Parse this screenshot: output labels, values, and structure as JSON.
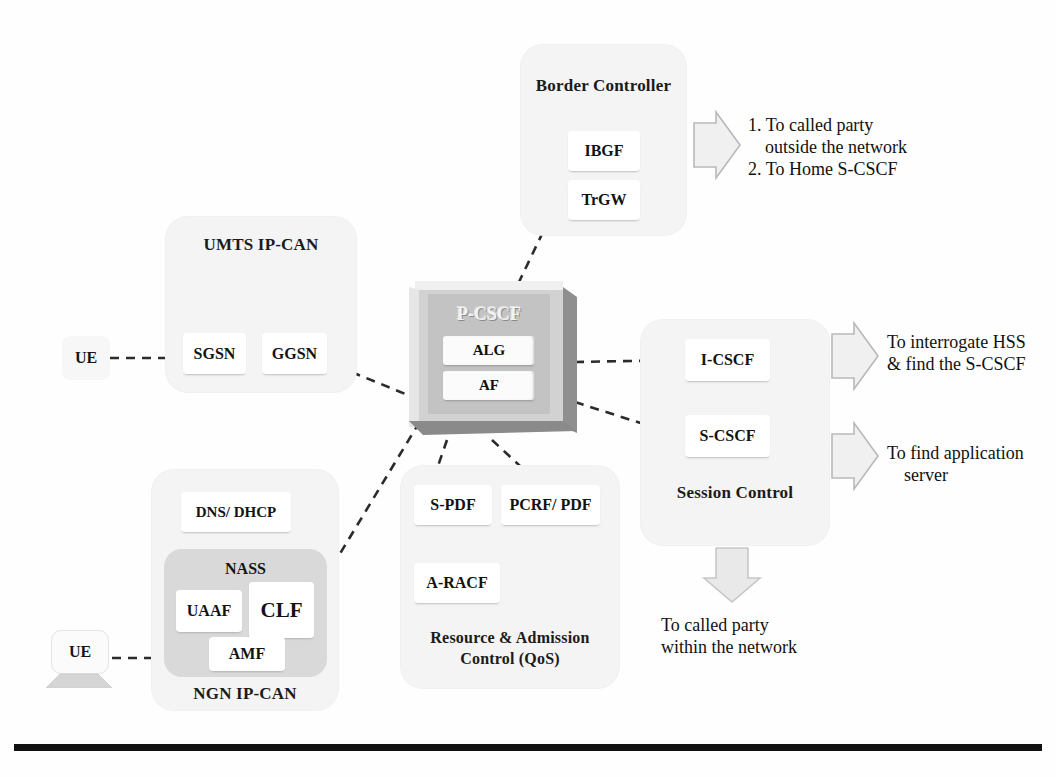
{
  "groups": {
    "border_controller": {
      "label": "Border Controller",
      "nodes": [
        {
          "label": "IBGF"
        },
        {
          "label": "TrGW"
        }
      ]
    },
    "umts": {
      "label": "UMTS IP-CAN",
      "nodes": [
        {
          "label": "SGSN"
        },
        {
          "label": "GGSN"
        }
      ]
    },
    "ngn": {
      "label": "NGN IP-CAN",
      "nodes": [
        {
          "label": "DNS/ DHCP"
        }
      ],
      "nass": {
        "label": "NASS",
        "nodes": [
          {
            "label": "UAAF"
          },
          {
            "label": "CLF"
          },
          {
            "label": "AMF"
          }
        ]
      }
    },
    "rac": {
      "label_line1": "Resource & Admission",
      "label_line2": "Control (QoS)",
      "nodes": [
        {
          "label": "S-PDF"
        },
        {
          "label": "PCRF/ PDF"
        },
        {
          "label": "A-RACF"
        }
      ]
    },
    "session_control": {
      "label": "Session Control",
      "nodes": [
        {
          "label": "I-CSCF"
        },
        {
          "label": "S-CSCF"
        }
      ]
    }
  },
  "core": {
    "title": "P-CSCF",
    "inner_nodes": [
      {
        "label": "ALG"
      },
      {
        "label": "AF"
      }
    ]
  },
  "endpoints": {
    "ue_umts": {
      "label": "UE"
    },
    "ue_ngn": {
      "label": "UE"
    }
  },
  "annotations": {
    "border_out": {
      "line1": "1. To called party",
      "line2": "outside the network",
      "line3": "2. To Home S-CSCF"
    },
    "icscf_out": {
      "line1": "To interrogate HSS",
      "line2": "& find the S-CSCF"
    },
    "scscf_out": {
      "line1": "To find application",
      "line2": "server"
    },
    "session_down": {
      "line1": "To called party",
      "line2": "within the network"
    }
  },
  "colors": {
    "group_fill": "#f4f4f4",
    "nass_fill": "#d9d9d9",
    "node_fill": "#ffffff",
    "core_face": "#c3c3c3",
    "core_frame": "#d2d2d2",
    "bevel_dark": "#8a8a8a",
    "connector": "#2b2b2b",
    "arrow_fill": "#f0f0f0",
    "arrow_stroke": "#b9b9b9",
    "text": "#111111",
    "rule": "#111111"
  }
}
